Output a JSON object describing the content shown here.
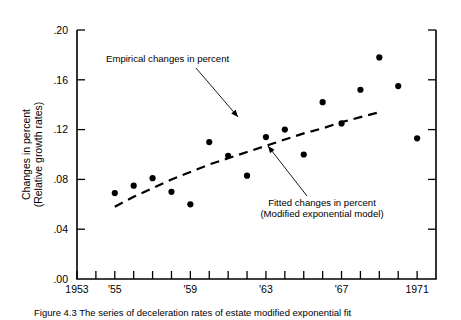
{
  "figure": {
    "caption": "Figure 4.3   The series of deceleration rates of estate modified exponential fit",
    "y_axis_title_line1": "Changes in percent",
    "y_axis_title_line2": "(Relative growth rates)"
  },
  "annotations": [
    {
      "id": "empirical",
      "text_lines": [
        "Empirical changes in percent"
      ],
      "text_x": 106,
      "text_y": 62,
      "anchor": "start",
      "leader": {
        "x1": 196,
        "y1": 68,
        "x2": 238,
        "y2": 117
      },
      "arrow_at": {
        "x": 238,
        "y": 117
      }
    },
    {
      "id": "fitted",
      "text_lines": [
        "Fitted changes in percent",
        "(Modified exponential model)"
      ],
      "text_x": 322,
      "text_y": 206,
      "anchor": "middle",
      "leader": {
        "x1": 307,
        "y1": 196,
        "x2": 268,
        "y2": 146
      },
      "arrow_at": {
        "x": 268,
        "y": 146
      }
    }
  ],
  "chart_data": {
    "type": "scatter",
    "title": "",
    "xlabel": "",
    "ylabel": "Changes in percent (Relative growth rates)",
    "xlim": [
      1953,
      1972
    ],
    "ylim": [
      0.0,
      0.2
    ],
    "grid": false,
    "legend": "none",
    "ytick_values": [
      0.2,
      0.16,
      0.12,
      0.08,
      0.04,
      0.0
    ],
    "ytick_labels": [
      ".20",
      ".16",
      ".12",
      ".08",
      ".04",
      ".00"
    ],
    "xtick_values": [
      1953,
      1954,
      1955,
      1956,
      1957,
      1958,
      1959,
      1960,
      1961,
      1962,
      1963,
      1964,
      1965,
      1966,
      1967,
      1968,
      1969,
      1970,
      1971
    ],
    "xtick_labeled": [
      {
        "value": 1953,
        "label": "1953"
      },
      {
        "value": 1955,
        "label": "'55"
      },
      {
        "value": 1959,
        "label": "'59"
      },
      {
        "value": 1963,
        "label": "'63"
      },
      {
        "value": 1967,
        "label": "'67"
      },
      {
        "value": 1971,
        "label": "1971"
      }
    ],
    "series": [
      {
        "name": "Empirical changes in percent",
        "type": "scatter",
        "marker": "filled-circle",
        "x": [
          1955,
          1956,
          1957,
          1958,
          1959,
          1960,
          1961,
          1962,
          1963,
          1964,
          1965,
          1966,
          1967,
          1968,
          1969,
          1970,
          1971
        ],
        "y": [
          0.069,
          0.075,
          0.081,
          0.07,
          0.06,
          0.11,
          0.099,
          0.083,
          0.114,
          0.12,
          0.1,
          0.142,
          0.125,
          0.152,
          0.178,
          0.155,
          0.113
        ]
      },
      {
        "name": "Fitted changes in percent (Modified exponential model)",
        "type": "line",
        "style": "dashed",
        "x": [
          1955,
          1956,
          1957,
          1958,
          1959,
          1960,
          1961,
          1962,
          1963,
          1964,
          1965,
          1966,
          1967,
          1968,
          1969
        ],
        "y": [
          0.058,
          0.066,
          0.073,
          0.08,
          0.086,
          0.092,
          0.097,
          0.102,
          0.107,
          0.112,
          0.117,
          0.121,
          0.126,
          0.13,
          0.134
        ]
      }
    ]
  }
}
